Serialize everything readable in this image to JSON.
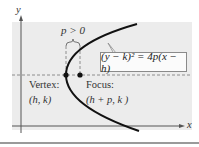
{
  "figure": {
    "type": "parabola-horizontal-axis",
    "axes": {
      "x_label": "x",
      "y_label": "y"
    },
    "equation": "(y − k)² = 4p(x − h)",
    "p_label": "p > 0",
    "vertex": {
      "label": "Vertex:",
      "coords": "(h, k)"
    },
    "focus": {
      "label": "Focus:",
      "coords": "(h + p, k )"
    },
    "colors": {
      "shade": "#ececec",
      "curve": "#111111",
      "axis": "#555555",
      "dashed": "#777777",
      "box_border": "#8a8a8a"
    }
  }
}
